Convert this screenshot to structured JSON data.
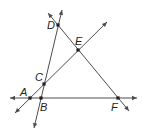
{
  "diagram": {
    "type": "geometry-lines",
    "points": [
      {
        "id": "A",
        "label": "A",
        "x": 30,
        "y": 98,
        "lx": 20,
        "ly": 96
      },
      {
        "id": "B",
        "label": "B",
        "x": 41,
        "y": 98,
        "lx": 40,
        "ly": 111
      },
      {
        "id": "C",
        "label": "C",
        "x": 44,
        "y": 84,
        "lx": 35,
        "ly": 81
      },
      {
        "id": "D",
        "label": "D",
        "x": 58,
        "y": 25,
        "lx": 47,
        "ly": 29
      },
      {
        "id": "E",
        "label": "E",
        "x": 78,
        "y": 50,
        "lx": 75,
        "ly": 45
      },
      {
        "id": "F",
        "label": "F",
        "x": 118,
        "y": 98,
        "lx": 111,
        "ly": 111
      }
    ],
    "lines": [
      {
        "name": "line-AB-BF",
        "through": [
          "A",
          "B",
          "F"
        ],
        "x1": 10,
        "y1": 98,
        "x2": 137,
        "y2": 98
      },
      {
        "name": "line-DCB",
        "through": [
          "D",
          "C",
          "B"
        ],
        "x1": 62,
        "y1": 10,
        "x2": 34,
        "y2": 128
      },
      {
        "name": "line-ACE",
        "through": [
          "A",
          "C",
          "E"
        ],
        "x1": 15,
        "y1": 113,
        "x2": 107,
        "y2": 22
      },
      {
        "name": "line-DEF",
        "through": [
          "D",
          "E",
          "F"
        ],
        "x1": 48,
        "y1": 13,
        "x2": 129,
        "y2": 111
      }
    ]
  }
}
